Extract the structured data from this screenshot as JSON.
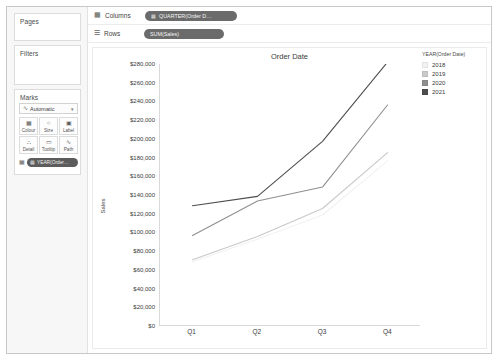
{
  "panels": {
    "pages": {
      "title": "Pages"
    },
    "filters": {
      "title": "Filters"
    },
    "marks": {
      "title": "Marks",
      "mark_type": "Automatic",
      "mark_type_icon": "line-mark-icon",
      "caret_icon": "chevron-down-icon",
      "buttons": [
        {
          "label": "Colour",
          "icon": "colour-icon",
          "glyph": "░"
        },
        {
          "label": "Size",
          "icon": "size-icon",
          "glyph": "○"
        },
        {
          "label": "Label",
          "icon": "label-icon",
          "glyph": "▣"
        },
        {
          "label": "Detail",
          "icon": "detail-icon",
          "glyph": "∴"
        },
        {
          "label": "Tooltip",
          "icon": "tooltip-icon",
          "glyph": "▭"
        },
        {
          "label": "Path",
          "icon": "path-icon",
          "glyph": "∿"
        }
      ],
      "pill": {
        "label": "YEAR(Order…",
        "icon": "colour-legend-icon"
      }
    }
  },
  "shelves": {
    "columns": {
      "label": "Columns",
      "icon": "columns-icon",
      "pill": "QUARTER(Order D…",
      "pill_icon": "calendar-icon"
    },
    "rows": {
      "label": "Rows",
      "icon": "rows-icon",
      "pill": "SUM(Sales)",
      "pill_icon": "measure-icon"
    }
  },
  "legend": {
    "title": "YEAR(Order Date)",
    "items": [
      {
        "label": "2018",
        "color": "#f2f2f2"
      },
      {
        "label": "2019",
        "color": "#c9c9c9"
      },
      {
        "label": "2020",
        "color": "#8f8f8f"
      },
      {
        "label": "2021",
        "color": "#4d4d4d"
      }
    ]
  },
  "chart_data": {
    "type": "line",
    "title": "Order Date",
    "xlabel": "",
    "ylabel": "Sales",
    "categories": [
      "Q1",
      "Q2",
      "Q3",
      "Q4"
    ],
    "ylim": [
      0,
      280000
    ],
    "ytick_step": 20000,
    "ytick_labels": [
      "$280,000",
      "$260,000",
      "$240,000",
      "$220,000",
      "$200,000",
      "$180,000",
      "$160,000",
      "$140,000",
      "$120,000",
      "$100,000",
      "$80,000",
      "$60,000",
      "$40,000",
      "$20,000",
      "$0"
    ],
    "ytick_values": [
      280000,
      260000,
      240000,
      220000,
      200000,
      180000,
      160000,
      140000,
      120000,
      100000,
      80000,
      60000,
      40000,
      20000,
      0
    ],
    "grid": false,
    "legend_position": "right",
    "series": [
      {
        "name": "2018",
        "color": "#f2f2f2",
        "values": [
          68000,
          92000,
          118000,
          176000
        ]
      },
      {
        "name": "2019",
        "color": "#c9c9c9",
        "values": [
          70000,
          95000,
          125000,
          185000
        ]
      },
      {
        "name": "2020",
        "color": "#8f8f8f",
        "values": [
          96000,
          133000,
          148000,
          236000
        ]
      },
      {
        "name": "2021",
        "color": "#4d4d4d",
        "values": [
          128000,
          138000,
          197000,
          282000
        ]
      }
    ]
  }
}
